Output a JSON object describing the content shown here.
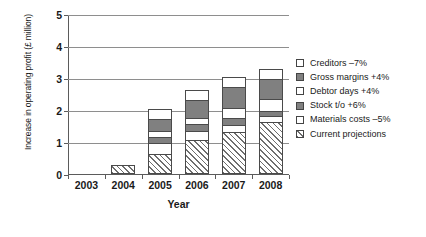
{
  "chart_data": {
    "type": "bar",
    "title": "",
    "subtitle": "",
    "xlabel": "Year",
    "ylabel": "Increase in operating profit (£ million)",
    "categories": [
      "2003",
      "2004",
      "2005",
      "2006",
      "2007",
      "2008"
    ],
    "ylim": [
      0,
      5
    ],
    "yticks": [
      0,
      1,
      2,
      3,
      4,
      5
    ],
    "ytick_labels": [
      "0",
      "1",
      "2",
      "3",
      "4",
      "5"
    ],
    "grid": true,
    "stacked": true,
    "legend_position": "right",
    "series": [
      {
        "name": "Current projections",
        "fill": "hatched",
        "values": [
          0,
          0.28,
          0.63,
          1.05,
          1.32,
          1.63
        ]
      },
      {
        "name": "Materials costs –5%",
        "fill": "white",
        "values": [
          0,
          0,
          0.35,
          0.28,
          0.2,
          0.18
        ]
      },
      {
        "name": "Stock t/o +6%",
        "fill": "gray",
        "values": [
          0,
          0,
          0.18,
          0.23,
          0.23,
          0.17
        ]
      },
      {
        "name": "Debtor days +4%",
        "fill": "white",
        "values": [
          0,
          0,
          0.17,
          0.18,
          0.3,
          0.37
        ]
      },
      {
        "name": "Gross margins +4%",
        "fill": "gray",
        "values": [
          0,
          0,
          0.4,
          0.58,
          0.68,
          0.62
        ]
      },
      {
        "name": "Creditors –7%",
        "fill": "white",
        "values": [
          0,
          0,
          0.3,
          0.32,
          0.3,
          0.3
        ]
      }
    ],
    "totals": [
      0,
      0.28,
      2.03,
      2.64,
      3.03,
      3.54
    ]
  },
  "legend": {
    "items": [
      {
        "label": "Creditors –7%",
        "fill": "white"
      },
      {
        "label": "Gross margins +4%",
        "fill": "gray"
      },
      {
        "label": "Debtor days +4%",
        "fill": "white"
      },
      {
        "label": "Stock t/o +6%",
        "fill": "gray"
      },
      {
        "label": "Materials costs –5%",
        "fill": "white"
      },
      {
        "label": "Current projections",
        "fill": "hatched"
      }
    ]
  },
  "colors": {
    "gray_fill": "#808080",
    "white_fill": "#ffffff",
    "outline": "#4a4a4a",
    "gridline": "#8e8e8e",
    "axis": "#5b5b5b",
    "text": "#1a1a1a"
  }
}
